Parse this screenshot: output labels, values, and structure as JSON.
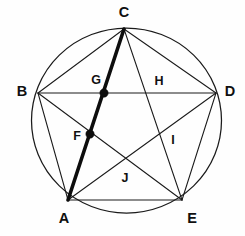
{
  "figure": {
    "canvas": {
      "width": 245,
      "height": 236,
      "background": "#fefefe"
    },
    "circle": {
      "cx": 126.5,
      "cy": 120.5,
      "r": 92.5,
      "stroke": "#1a1a1a",
      "stroke_width": 1.25
    },
    "stroke_color": "#1a1a1a",
    "highlight_color": "#0d0d0d",
    "vertices": [
      {
        "id": "A",
        "label": "A",
        "x": 68,
        "y": 200,
        "label_x": 64,
        "label_y": 219
      },
      {
        "id": "B",
        "label": "B",
        "x": 38,
        "y": 93,
        "label_x": 22,
        "label_y": 92
      },
      {
        "id": "C",
        "label": "C",
        "x": 124,
        "y": 29,
        "label_x": 124,
        "label_y": 13
      },
      {
        "id": "D",
        "label": "D",
        "x": 216,
        "y": 93,
        "label_x": 230,
        "label_y": 92
      },
      {
        "id": "E",
        "label": "E",
        "x": 182,
        "y": 200,
        "label_x": 192,
        "label_y": 219
      }
    ],
    "intersection_points": [
      {
        "id": "F",
        "label": "F",
        "x": 90,
        "y": 134,
        "label_x": 77,
        "label_y": 137,
        "marked": true
      },
      {
        "id": "G",
        "label": "G",
        "x": 104,
        "y": 93,
        "label_x": 96,
        "label_y": 81,
        "marked": true
      },
      {
        "id": "H",
        "label": "H",
        "x": 151,
        "y": 93,
        "label_x": 159,
        "label_y": 82,
        "marked": false
      },
      {
        "id": "I",
        "label": "I",
        "x": 164,
        "y": 131,
        "label_x": 173,
        "label_y": 141,
        "marked": false
      },
      {
        "id": "J",
        "label": "J",
        "x": 126,
        "y": 166,
        "label_x": 125,
        "label_y": 179,
        "marked": false
      }
    ],
    "chords": [
      {
        "id": "BC",
        "from": "B",
        "to": "C",
        "x1": 38,
        "y1": 93,
        "x2": 124,
        "y2": 29
      },
      {
        "id": "CD",
        "from": "C",
        "to": "D",
        "x1": 124,
        "y1": 29,
        "x2": 216,
        "y2": 93
      },
      {
        "id": "BD",
        "from": "B",
        "to": "D",
        "x1": 38,
        "y1": 93,
        "x2": 216,
        "y2": 93
      },
      {
        "id": "AB",
        "from": "A",
        "to": "B",
        "x1": 68,
        "y1": 200,
        "x2": 38,
        "y2": 93
      },
      {
        "id": "AE",
        "from": "A",
        "to": "E",
        "x1": 68,
        "y1": 200,
        "x2": 182,
        "y2": 200
      },
      {
        "id": "DE",
        "from": "D",
        "to": "E",
        "x1": 216,
        "y1": 93,
        "x2": 182,
        "y2": 200
      },
      {
        "id": "BE",
        "from": "B",
        "to": "E",
        "x1": 38,
        "y1": 93,
        "x2": 182,
        "y2": 200
      },
      {
        "id": "AD",
        "from": "A",
        "to": "D",
        "x1": 68,
        "y1": 200,
        "x2": 216,
        "y2": 93
      },
      {
        "id": "CE",
        "from": "C",
        "to": "E",
        "x1": 124,
        "y1": 29,
        "x2": 182,
        "y2": 200
      }
    ],
    "highlighted_chords": [
      {
        "id": "CA",
        "from": "C",
        "to": "A",
        "x1": 124,
        "y1": 29,
        "x2": 68,
        "y2": 200,
        "width": 3.6
      }
    ],
    "dot_radius": 4.2
  }
}
